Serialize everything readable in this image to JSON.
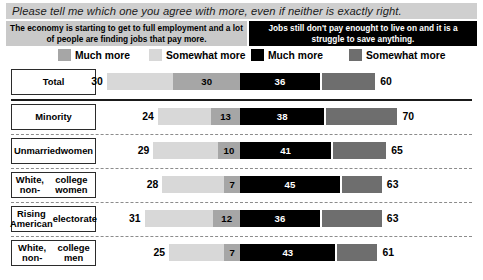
{
  "question": {
    "text": "Please tell me which one you agree with more, even if neither is exactly right."
  },
  "statements": {
    "left": "The economy is starting to get to full employment and a lot of people are finding jobs that pay more.",
    "right": "Jobs still don't pay enought to live on and it is a struggle to save anything."
  },
  "legend": {
    "items": [
      {
        "label": "Much more",
        "color": "#a6a6a6",
        "side": "left",
        "key": "left_much"
      },
      {
        "label": "Somewhat more",
        "color": "#d8d8d8",
        "side": "left",
        "key": "left_somewhat"
      },
      {
        "label": "Much more",
        "color": "#000000",
        "side": "right",
        "key": "right_much"
      },
      {
        "label": "Somewhat more",
        "color": "#6e6e6e",
        "side": "right",
        "key": "right_somewhat"
      }
    ]
  },
  "chart_data": {
    "type": "bar",
    "subtype": "diverging-stacked-bar",
    "title": "Please tell me which one you agree with more, even if neither is exactly right.",
    "xlabel": "",
    "ylabel": "",
    "grid": false,
    "legend_position": "top",
    "axis_center": 0,
    "categories": [
      "Total",
      "Minority",
      "Unmarried women",
      "White, non-college women",
      "Rising American electorate",
      "White, non-college men"
    ],
    "series": [
      {
        "name": "Economy improving — Much more",
        "side": "left",
        "color": "#a6a6a6",
        "values": [
          30,
          13,
          10,
          7,
          12,
          7
        ]
      },
      {
        "name": "Economy improving — Total",
        "side": "left",
        "color": "#d8d8d8",
        "values": [
          30,
          24,
          29,
          28,
          31,
          25
        ]
      },
      {
        "name": "Jobs don't pay — Much more",
        "side": "right",
        "color": "#000000",
        "values": [
          36,
          38,
          41,
          45,
          36,
          43
        ]
      },
      {
        "name": "Jobs don't pay — Total",
        "side": "right",
        "color": "#6e6e6e",
        "values": [
          60,
          70,
          65,
          63,
          63,
          61
        ]
      }
    ],
    "rows": [
      {
        "label": "Total",
        "left_total": 30,
        "left_much": 30,
        "right_much": 36,
        "right_total": 60
      },
      {
        "label": "Minority",
        "left_total": 24,
        "left_much": 13,
        "right_much": 38,
        "right_total": 70
      },
      {
        "label": "Unmarried women",
        "left_total": 29,
        "left_much": 10,
        "right_much": 41,
        "right_total": 65
      },
      {
        "label": "White, non-college women",
        "left_total": 28,
        "left_much": 7,
        "right_much": 45,
        "right_total": 63
      },
      {
        "label": "Rising American electorate",
        "left_total": 31,
        "left_much": 12,
        "right_much": 36,
        "right_total": 63
      },
      {
        "label": "White, non-college men",
        "left_total": 25,
        "left_much": 7,
        "right_much": 43,
        "right_total": 61
      }
    ]
  },
  "rows_display": [
    {
      "label_line1": "Total",
      "label_line2": "",
      "left_total": "30",
      "left_much": "30",
      "right_much": "36",
      "right_total": "60"
    },
    {
      "label_line1": "Minority",
      "label_line2": "",
      "left_total": "24",
      "left_much": "13",
      "right_much": "38",
      "right_total": "70"
    },
    {
      "label_line1": "Unmarried",
      "label_line2": "women",
      "left_total": "29",
      "left_much": "10",
      "right_much": "41",
      "right_total": "65"
    },
    {
      "label_line1": "White, non-",
      "label_line2": "college women",
      "left_total": "28",
      "left_much": "7",
      "right_much": "45",
      "right_total": "63"
    },
    {
      "label_line1": "Rising American",
      "label_line2": "electorate",
      "left_total": "31",
      "left_much": "12",
      "right_much": "36",
      "right_total": "63"
    },
    {
      "label_line1": "White, non-",
      "label_line2": "college men",
      "left_total": "25",
      "left_much": "7",
      "right_much": "43",
      "right_total": "61"
    }
  ],
  "colors": {
    "left_much": "#a6a6a6",
    "left_somewhat": "#d8d8d8",
    "right_much": "#000000",
    "right_somewhat": "#6e6e6e",
    "banner_bg": "#cfcfcf",
    "stmt_left_bg": "#c9c9c9",
    "stmt_right_bg": "#000000"
  }
}
